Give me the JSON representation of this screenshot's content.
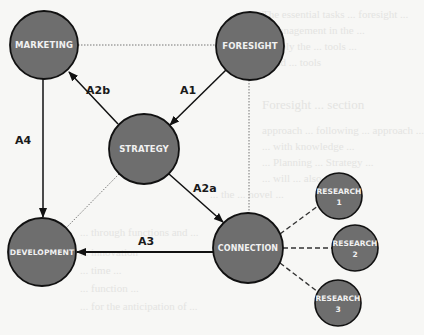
{
  "diagram": {
    "colors": {
      "node_fill": "#6e6e6e",
      "node_stroke": "#111111",
      "node_text": "#f1f1f1",
      "arrow": "#111111",
      "dotted": "#777777",
      "background": "#f7f7f5"
    },
    "nodes": [
      {
        "id": "marketing",
        "label": "MARKETING",
        "cx": 44,
        "cy": 45,
        "r": 34
      },
      {
        "id": "foresight",
        "label": "FORESIGHT",
        "cx": 250,
        "cy": 46,
        "r": 34
      },
      {
        "id": "strategy",
        "label": "STRATEGY",
        "cx": 144,
        "cy": 149,
        "r": 35
      },
      {
        "id": "development",
        "label": "DEVELOPMENT",
        "cx": 42,
        "cy": 252,
        "r": 34
      },
      {
        "id": "connection",
        "label": "CONNECTION",
        "cx": 248,
        "cy": 248,
        "r": 35
      },
      {
        "id": "research1",
        "label": "RESEARCH",
        "sublabel": "1",
        "cx": 339,
        "cy": 196,
        "r": 23
      },
      {
        "id": "research2",
        "label": "RESEARCH",
        "sublabel": "2",
        "cx": 355,
        "cy": 248,
        "r": 23
      },
      {
        "id": "research3",
        "label": "RESEARCH",
        "sublabel": "3",
        "cx": 338,
        "cy": 303,
        "r": 23
      }
    ],
    "edges": [
      {
        "from": "foresight",
        "to": "strategy",
        "style": "arrow",
        "label": "A1"
      },
      {
        "from": "strategy",
        "to": "marketing",
        "style": "arrow",
        "label": "A2b"
      },
      {
        "from": "strategy",
        "to": "connection",
        "style": "arrow",
        "label": "A2a"
      },
      {
        "from": "connection",
        "to": "development",
        "style": "arrow",
        "label": "A3"
      },
      {
        "from": "marketing",
        "to": "development",
        "style": "arrow",
        "label": "A4"
      },
      {
        "from": "marketing",
        "to": "foresight",
        "style": "dotted",
        "label": ""
      },
      {
        "from": "foresight",
        "to": "connection",
        "style": "dotted",
        "label": ""
      },
      {
        "from": "strategy",
        "to": "development",
        "style": "dotted",
        "label": ""
      },
      {
        "from": "connection",
        "to": "research1",
        "style": "dashed",
        "label": ""
      },
      {
        "from": "connection",
        "to": "research2",
        "style": "dashed",
        "label": ""
      },
      {
        "from": "connection",
        "to": "research3",
        "style": "dashed",
        "label": ""
      }
    ],
    "edge_labels": {
      "a1": "A1",
      "a2b": "A2b",
      "a2a": "A2a",
      "a3": "A3",
      "a4": "A4"
    }
  },
  "background_bleed_text": [
    "The essential tasks ... foresight ...",
    "management in the ...",
    "apply the ... tools ...",
    "and ... tools",
    "Foresight ... section",
    "approach ... following ... approach ...",
    "... with knowledge ...",
    "... Planning ... Strategy ...",
    "... will ... also ...",
    "... the ... novel ...",
    "... through functions and ...",
    "... innovation",
    "... time ...",
    "... function ...",
    "... for the anticipation of ..."
  ]
}
